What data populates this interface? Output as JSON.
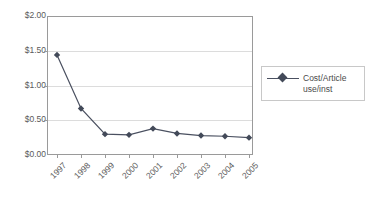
{
  "chart_data": {
    "type": "line",
    "title": "",
    "subtitle": "",
    "xlabel": "",
    "ylabel": "",
    "categories": [
      "1997",
      "1998",
      "1999",
      "2000",
      "2001",
      "2002",
      "2003",
      "2004",
      "2005"
    ],
    "series": [
      {
        "name": "Cost/Article use/inst",
        "values": [
          1.44,
          0.67,
          0.3,
          0.29,
          0.38,
          0.31,
          0.28,
          0.27,
          0.25
        ]
      }
    ],
    "ylim": [
      0,
      2
    ],
    "ytick_values": [
      0,
      0.5,
      1,
      1.5,
      2
    ],
    "ytick_labels": [
      "$0.00",
      "$0.50",
      "$1.00",
      "$1.50",
      "$2.00"
    ],
    "xtick_labels": [
      "1997",
      "1998",
      "1999",
      "2000",
      "2001",
      "2002",
      "2003",
      "2004",
      "2005"
    ],
    "grid": "horizontal",
    "legend_position": "right",
    "legend_entries": [
      "Cost/Article use/inst"
    ],
    "marker": "diamond",
    "series_color": "#4a5060",
    "grid_color": "#dcdcdc",
    "axis_color": "#9a9a9a",
    "text_color": "#5a5a5a",
    "background": "#ffffff"
  },
  "legend": {
    "entry_label": "Cost/Article\nuse/inst"
  },
  "axes": {
    "y": {
      "t0": "$0.00",
      "t1": "$0.50",
      "t2": "$1.00",
      "t3": "$1.50",
      "t4": "$2.00"
    },
    "x": {
      "t0": "1997",
      "t1": "1998",
      "t2": "1999",
      "t3": "2000",
      "t4": "2001",
      "t5": "2002",
      "t6": "2003",
      "t7": "2004",
      "t8": "2005"
    }
  }
}
